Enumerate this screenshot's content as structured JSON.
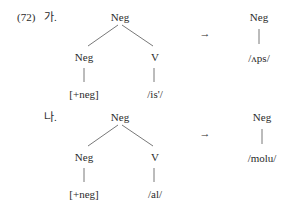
{
  "example_number": "(72)",
  "examples": [
    {
      "label": "가.",
      "tree": {
        "root": "Neg",
        "left_child": "Neg",
        "left_leaf": "[+neg]",
        "right_child": "V",
        "right_leaf": "/is'/"
      },
      "arrow": "→",
      "result": {
        "node": "Neg",
        "leaf": "/ʌps/"
      }
    },
    {
      "label": "나.",
      "tree": {
        "root": "Neg",
        "left_child": "Neg",
        "left_leaf": "[+neg]",
        "right_child": "V",
        "right_leaf": "/al/"
      },
      "arrow": "→",
      "result": {
        "node": "Neg",
        "leaf": "/molu/"
      }
    }
  ]
}
